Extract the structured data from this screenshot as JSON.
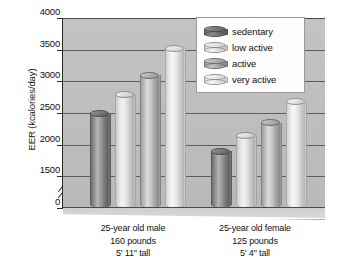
{
  "chart_data": {
    "type": "bar",
    "title": "",
    "subtitle": "",
    "xlabel": "",
    "ylabel": "EER (kcalories/day)",
    "ylim": [
      0,
      4000
    ],
    "y_axis_break": true,
    "y_break_note": "axis broken between 0 and 1500",
    "yticks": [
      0,
      1500,
      2000,
      2500,
      3000,
      3500,
      4000
    ],
    "ytick_labels": [
      "0",
      "1500",
      "2000",
      "2500",
      "3000",
      "3500",
      "4000"
    ],
    "grid": true,
    "legend_position": "top-right",
    "categories": [
      "25-year old male\n160 pounds\n5' 11\" tall",
      "25-year old female\n125 pounds\n5' 4\" tall"
    ],
    "series": [
      {
        "name": "sedentary",
        "values": [
          2500,
          1900
        ]
      },
      {
        "name": "low active",
        "values": [
          2800,
          2150
        ]
      },
      {
        "name": "active",
        "values": [
          3100,
          2350
        ]
      },
      {
        "name": "very active",
        "values": [
          3520,
          2680
        ]
      }
    ]
  },
  "axis": {
    "y_title": "EER (kcalories/day)",
    "ticks": [
      {
        "label": "4000",
        "value": 4000
      },
      {
        "label": "3500",
        "value": 3500
      },
      {
        "label": "3000",
        "value": 3000
      },
      {
        "label": "2500",
        "value": 2500
      },
      {
        "label": "2000",
        "value": 2000
      },
      {
        "label": "1500",
        "value": 1500
      },
      {
        "label": "0",
        "value": 0
      }
    ]
  },
  "legend": {
    "items": [
      {
        "label": "sedentary",
        "tone": "sedentary",
        "color": "#6f6f6f"
      },
      {
        "label": "low active",
        "tone": "low",
        "color": "#e2e2e2"
      },
      {
        "label": "active",
        "tone": "active",
        "color": "#bdbdbd"
      },
      {
        "label": "very active",
        "tone": "very",
        "color": "#e8e8e8"
      }
    ]
  },
  "groups": [
    {
      "id": "male",
      "line1": "25-year old male",
      "line2": "160 pounds",
      "line3": "5' 11\" tall",
      "bars": [
        {
          "series": "sedentary",
          "value": 2500,
          "tone": "sedentary"
        },
        {
          "series": "low active",
          "value": 2800,
          "tone": "low"
        },
        {
          "series": "active",
          "value": 3100,
          "tone": "active"
        },
        {
          "series": "very active",
          "value": 3520,
          "tone": "very"
        }
      ]
    },
    {
      "id": "female",
      "line1": "25-year old female",
      "line2": "125 pounds",
      "line3": "5' 4\" tall",
      "bars": [
        {
          "series": "sedentary",
          "value": 1900,
          "tone": "sedentary"
        },
        {
          "series": "low active",
          "value": 2150,
          "tone": "low"
        },
        {
          "series": "active",
          "value": 2350,
          "tone": "active"
        },
        {
          "series": "very active",
          "value": 2680,
          "tone": "very"
        }
      ]
    }
  ],
  "colors": {
    "plot_background": "#bebebe",
    "gridline": "#5d5d5d",
    "axis": "#2a2a2a",
    "legend_background": "#fdfdfd",
    "text": "#111111"
  }
}
